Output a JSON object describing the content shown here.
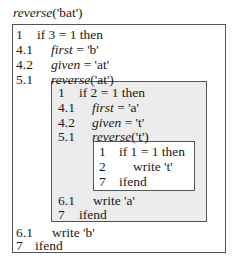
{
  "title": {
    "func": "reverse",
    "arg": "('bat')"
  },
  "outer": {
    "lines": [
      {
        "num": "1",
        "text": "if 3 = 1 then"
      },
      {
        "num": "4.1",
        "var": "first",
        "rest": " = 'b'"
      },
      {
        "num": "4.2",
        "var": "given",
        "rest": " = 'at'"
      },
      {
        "num": "5.1",
        "var": "reverse",
        "rest": "('at')"
      }
    ],
    "tail": [
      {
        "num": "6.1",
        "text": "write 'b'"
      },
      {
        "num": "7",
        "text": "ifend"
      }
    ]
  },
  "mid": {
    "lines": [
      {
        "num": "1",
        "text": "if 2 = 1 then"
      },
      {
        "num": "4.1",
        "var": "first",
        "rest": " = 'a'"
      },
      {
        "num": "4.2",
        "var": "given",
        "rest": " = 't'"
      },
      {
        "num": "5.1",
        "var": "reverse",
        "rest": "('t')"
      }
    ],
    "tail": [
      {
        "num": "6.1",
        "text": "write 'a'"
      },
      {
        "num": "7",
        "text": "ifend"
      }
    ]
  },
  "inner": {
    "lines": [
      {
        "num": "1",
        "text": "if 1 = 1 then"
      },
      {
        "num": "2",
        "text": "write 't'"
      },
      {
        "num": "7",
        "text": "ifend"
      }
    ]
  }
}
